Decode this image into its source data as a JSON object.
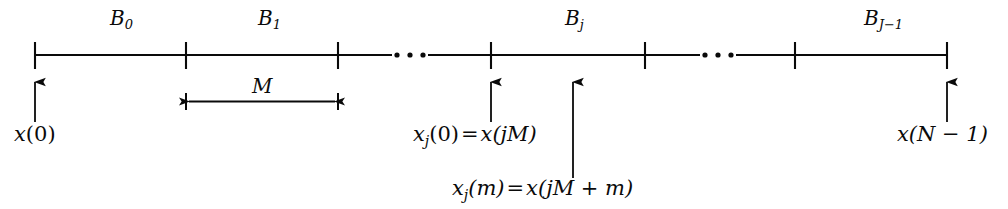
{
  "figure": {
    "type": "block-segmentation-timeline",
    "axis": {
      "x_start": 35,
      "x_end": 947,
      "y": 55,
      "tick_positions": [
        35,
        186,
        338,
        491,
        645,
        795,
        947
      ],
      "tick_half_height": 13,
      "ellipsis_gaps": [
        {
          "from": 338,
          "to": 491,
          "dots_center": 410
        },
        {
          "from": 645,
          "to": 795,
          "dots_center": 718
        }
      ]
    },
    "block_labels": [
      {
        "name": "B",
        "subscript": "0",
        "x": 110,
        "y": 10
      },
      {
        "name": "B",
        "subscript": "1",
        "x": 258,
        "y": 10
      },
      {
        "name": "B",
        "subscript": "j",
        "x": 565,
        "y": 10
      },
      {
        "name": "B",
        "subscript": "J-1",
        "x": 868,
        "y": 10
      }
    ],
    "dimension": {
      "label": "M",
      "label_x": 256,
      "label_y": 80,
      "x_left": 186,
      "x_right": 338,
      "y": 101
    },
    "pointers": [
      {
        "id": "x-zero",
        "arrow_x": 35,
        "arrow_tail_y": 122,
        "arrow_head_y": 80,
        "label": "x(0)",
        "label_x": 14,
        "label_y": 126
      },
      {
        "id": "xj-zero",
        "arrow_x": 491,
        "arrow_tail_y": 122,
        "arrow_head_y": 80,
        "label": "x_j(0) = x(jM)",
        "label_x": 413,
        "label_y": 126
      },
      {
        "id": "xj-m",
        "arrow_x": 573,
        "arrow_tail_y": 178,
        "arrow_head_y": 80,
        "label": "x_j(m) = x(jM + m)",
        "label_x": 452,
        "label_y": 180
      },
      {
        "id": "x-n-minus-1",
        "arrow_x": 947,
        "arrow_tail_y": 122,
        "arrow_head_y": 80,
        "label": "x(N - 1)",
        "label_x": 897,
        "label_y": 126
      }
    ],
    "text": {
      "b0_base": "B",
      "b0_sub": "0",
      "b1_base": "B",
      "b1_sub": "1",
      "bj_base": "B",
      "bj_sub": "j",
      "bjm1_base": "B",
      "bjm1_sub": "J−1",
      "m_label": "M",
      "x0_base": "x",
      "x0_arg": "(0)",
      "xj0_base": "x",
      "xj0_sub": "j",
      "xj0_arg": "(0)",
      "xj0_eq": "=",
      "xj0_rhs_base": "x",
      "xj0_rhs_arg": "(jM)",
      "xjm_base": "x",
      "xjm_sub": "j",
      "xjm_arg": "(m)",
      "xjm_eq": "=",
      "xjm_rhs_base": "x",
      "xjm_rhs_arg": "(jM + m)",
      "xn_base": "x",
      "xn_arg": "(N − 1)"
    },
    "colors": {
      "ink": "#0a0a0a",
      "background": "#ffffff"
    }
  }
}
